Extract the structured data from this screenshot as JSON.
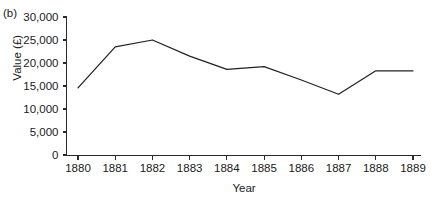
{
  "figure": {
    "panel_label": "(b)"
  },
  "chart_data": {
    "type": "line",
    "title": "",
    "subtitle": "",
    "xlabel": "Year",
    "ylabel": "Value (£)",
    "categories": [
      "1880",
      "1881",
      "1882",
      "1883",
      "1884",
      "1885",
      "1886",
      "1887",
      "1888",
      "1889"
    ],
    "x": [
      1880,
      1881,
      1882,
      1883,
      1884,
      1885,
      1886,
      1887,
      1888,
      1889
    ],
    "values": [
      14600,
      23500,
      25000,
      21500,
      18600,
      19200,
      16300,
      13200,
      18300,
      18300
    ],
    "series": [
      {
        "name": "Value",
        "values": [
          14600,
          23500,
          25000,
          21500,
          18600,
          19200,
          16300,
          13200,
          18300,
          18300
        ]
      }
    ],
    "ylim": [
      0,
      30000
    ],
    "xlim": [
      1880,
      1889
    ],
    "ytick_values": [
      0,
      5000,
      10000,
      15000,
      20000,
      25000,
      30000
    ],
    "ytick_labels": [
      "0",
      "5,000",
      "10,000",
      "15,000",
      "20,000",
      "25,000",
      "30,000"
    ],
    "xtick_labels": [
      "1880",
      "1881",
      "1882",
      "1883",
      "1884",
      "1885",
      "1886",
      "1887",
      "1888",
      "1889"
    ],
    "grid": false,
    "legend": false,
    "legend_position": "none",
    "line_color": "#222222",
    "markers": false,
    "annotations": []
  }
}
